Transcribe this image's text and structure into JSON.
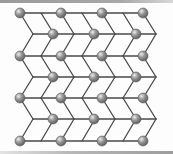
{
  "diagram": {
    "type": "lattice",
    "colors": {
      "edge": "#4a4a4a",
      "node_fill": "#8c8c8c",
      "node_highlight": "#e6e6e6",
      "node_stroke": "#5a5a5a",
      "background": "#fdfdfd",
      "frame_bar": "#a0a0a0"
    },
    "rows_y": [
      13,
      34,
      56,
      77,
      98,
      119,
      141
    ],
    "chevron_columns_x": [
      20,
      41,
      61,
      82,
      102,
      123,
      143
    ],
    "chevron_offset": 13,
    "even_row_line": {
      "x1": 20,
      "x2": 143
    },
    "odd_row_line": {
      "x1": 33,
      "x2": 156
    },
    "even_row_nodes_x": [
      20,
      61,
      102,
      143
    ],
    "odd_row_nodes_x": [
      53,
      94,
      136
    ],
    "node_radius": 5
  }
}
